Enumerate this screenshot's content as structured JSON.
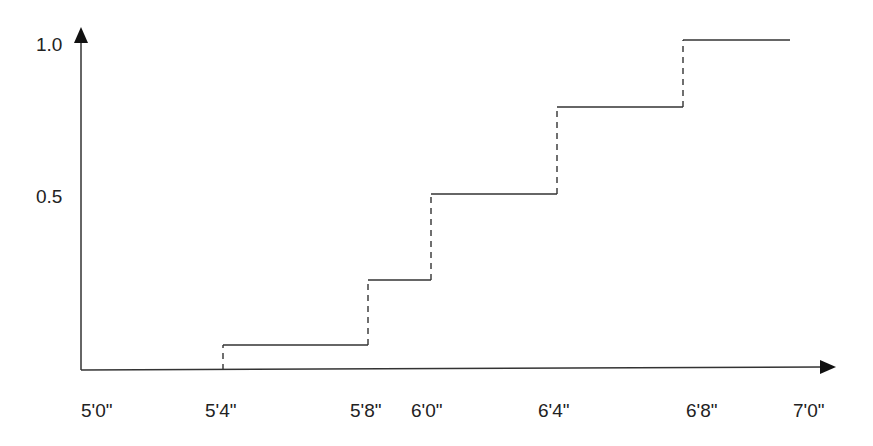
{
  "chart_data": {
    "type": "line",
    "subtype": "step-cdf",
    "title": "",
    "xlabel": "",
    "ylabel": "",
    "x_tick_labels": [
      "5'0\"",
      "5'4\"",
      "5'8\"",
      "6'0\"",
      "6'4\"",
      "6'8\"",
      "7'0\""
    ],
    "y_tick_labels": [
      "0.5",
      "1.0"
    ],
    "ylim": [
      0,
      1.0
    ],
    "grid": false,
    "legend": null,
    "steps": [
      {
        "x_start": "5'0\"",
        "x_end": "5'4\"",
        "y": 0.0
      },
      {
        "x_start": "5'4\"",
        "x_end": "5'8\"",
        "y": 0.08
      },
      {
        "x_start": "5'8\"",
        "x_end": "6'0\"",
        "y": 0.27
      },
      {
        "x_start": "6'0\"",
        "x_end": "6'4\"",
        "y": 0.53
      },
      {
        "x_start": "6'4\"",
        "x_end": "6'8\"",
        "y": 0.8
      },
      {
        "x_start": "6'8\"",
        "x_end": "7'0\"",
        "y": 1.0
      }
    ],
    "jumps_drawn_dashed": true
  },
  "geometry": {
    "origin": {
      "x": 81,
      "y": 370
    },
    "x_axis_end": 836,
    "y_axis_top": 27,
    "step_px": [
      {
        "x1": 223,
        "x2": 368,
        "y": 345
      },
      {
        "x1": 368,
        "x2": 431,
        "y": 280
      },
      {
        "x1": 431,
        "x2": 557,
        "y": 194
      },
      {
        "x1": 557,
        "x2": 683,
        "y": 107
      },
      {
        "x1": 683,
        "x2": 790,
        "y": 40
      }
    ],
    "x_label_px": [
      81,
      205,
      350,
      411,
      538,
      686,
      793
    ],
    "y_label_px": [
      {
        "text_index": 0,
        "y": 187
      },
      {
        "text_index": 1,
        "y": 35
      }
    ]
  },
  "colors": {
    "line": "#333333",
    "text": "#222222",
    "background": "#ffffff"
  }
}
